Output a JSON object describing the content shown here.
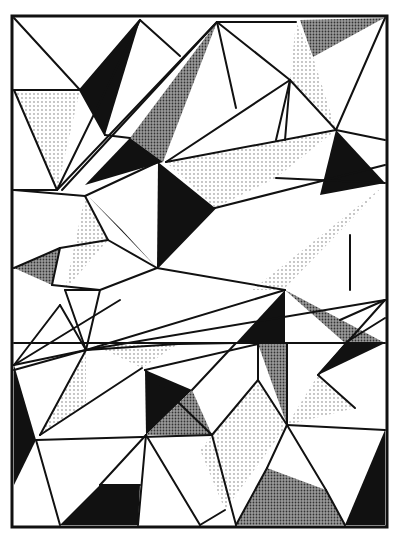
{
  "artwork": {
    "title": "Geometric triangle composition",
    "frame": {
      "x": 12,
      "y": 16,
      "w": 375,
      "h": 511
    },
    "colors": {
      "background": "#ffffff",
      "ink": "#111111",
      "light_dot": "#888888",
      "dark_dot": "#333333"
    },
    "fills": [
      {
        "type": "black",
        "points": "80,90 140,20 105,135"
      },
      {
        "type": "dark",
        "points": "130,138 217,22 163,162"
      },
      {
        "type": "black",
        "points": "85,185 130,138 163,162"
      },
      {
        "type": "light",
        "points": "14,90 80,90 57,190"
      },
      {
        "type": "dark",
        "points": "300,20 384,18 313,57"
      },
      {
        "type": "light",
        "points": "296,22 313,57 336,130 290,80"
      },
      {
        "type": "light",
        "points": "166,162 336,130 276,178 215,208"
      },
      {
        "type": "black",
        "points": "158,162 215,208 157,268"
      },
      {
        "type": "black",
        "points": "336,130 385,183 320,195"
      },
      {
        "type": "black",
        "points": "88,196 157,268 122,230"
      },
      {
        "type": "light",
        "points": "85,196 108,240 65,290"
      },
      {
        "type": "dark",
        "points": "14,268 60,248 52,285"
      },
      {
        "type": "light",
        "points": "252,290 385,185 283,290"
      },
      {
        "type": "black",
        "points": "236,343 285,290 285,343"
      },
      {
        "type": "dark",
        "points": "285,290 385,343 345,343"
      },
      {
        "type": "black",
        "points": "345,343 385,343 318,375"
      },
      {
        "type": "light",
        "points": "92,344 178,344 142,368"
      },
      {
        "type": "light",
        "points": "40,435 86,350 86,406"
      },
      {
        "type": "black",
        "points": "145,370 192,390 146,435"
      },
      {
        "type": "dark",
        "points": "146,435 192,390 212,435"
      },
      {
        "type": "dark",
        "points": "258,344 287,344 287,425"
      },
      {
        "type": "light",
        "points": "200,450 258,380 287,425 225,510"
      },
      {
        "type": "light",
        "points": "287,425 318,375 355,408"
      },
      {
        "type": "dark",
        "points": "236,525 267,468 326,490 345,525"
      },
      {
        "type": "black",
        "points": "345,525 385,430 385,525"
      },
      {
        "type": "black",
        "points": "14,365 36,440 14,485"
      },
      {
        "type": "black",
        "points": "60,525 100,485 140,485 138,525"
      }
    ],
    "lines": [
      "14,18 80,90",
      "80,90 105,135",
      "140,20 80,90",
      "140,20 180,56",
      "14,90 80,90",
      "57,190 14,90",
      "57,190 140,20",
      "57,190 217,22",
      "62,190 217,22",
      "105,135 130,138",
      "217,22 296,22",
      "217,22 236,108",
      "217,22 290,80",
      "166,162 290,80",
      "290,80 336,130",
      "290,80 276,140",
      "290,80 285,140",
      "336,130 385,18",
      "336,130 385,140",
      "166,162 336,130",
      "215,208 385,165",
      "14,190 85,196",
      "14,190 57,190",
      "85,196 108,240",
      "85,196 158,162",
      "108,240 157,268",
      "14,268 60,248",
      "60,248 108,240",
      "60,248 52,285",
      "52,285 100,290",
      "65,290 100,290",
      "100,290 157,268",
      "157,268 215,208",
      "157,268 285,290",
      "14,365 60,305",
      "14,365 120,300",
      "60,305 86,350",
      "86,350 65,290",
      "86,350 100,290",
      "86,350 178,344",
      "14,365 86,350",
      "86,350 385,300",
      "86,350 285,290",
      "14,370 86,350",
      "86,350 40,435",
      "178,344 236,343",
      "14,343 385,343",
      "145,370 212,435",
      "145,370 258,344",
      "192,390 236,343",
      "212,435 258,380",
      "258,380 258,344",
      "258,380 287,425",
      "40,435 142,368",
      "36,440 212,435",
      "36,440 60,525",
      "146,435 100,485",
      "146,435 138,525",
      "146,435 200,525",
      "212,435 236,525",
      "287,425 385,430",
      "287,425 267,468",
      "287,425 326,490",
      "326,490 345,525",
      "318,375 385,300",
      "318,375 355,408",
      "385,318 345,343",
      "340,320 385,300",
      "350,235 350,290",
      "276,178 385,183",
      "287,344 287,425",
      "267,468 236,525",
      "100,485 140,485",
      "225,510 200,525"
    ]
  }
}
